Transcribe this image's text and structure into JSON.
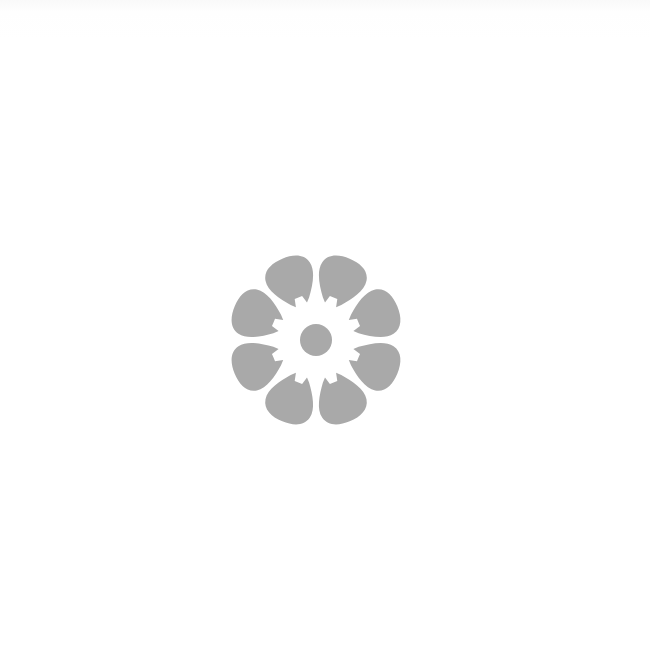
{
  "image": {
    "subject": "flower-icon",
    "petal_count": 8,
    "colors": {
      "background": "#ffffff",
      "flower": "#a9a9a9"
    },
    "center": {
      "x": 316,
      "y": 340
    },
    "center_radius": 16
  }
}
